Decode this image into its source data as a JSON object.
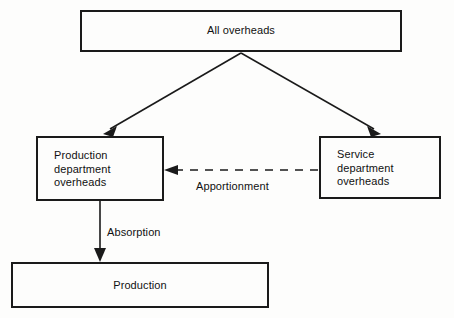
{
  "diagram": {
    "background_color": "#fdfdfc",
    "line_color": "#1a1a1a",
    "text_color": "#111111",
    "nodes": [
      {
        "id": "all_overheads",
        "label": "All overheads",
        "align": "center"
      },
      {
        "id": "production_department_overheads",
        "label": "Production\ndepartment\noverheads",
        "align": "left"
      },
      {
        "id": "service_department_overheads",
        "label": "Service\ndepartment\noverheads",
        "align": "left"
      },
      {
        "id": "production",
        "label": "Production",
        "align": "center"
      }
    ],
    "edges": [
      {
        "id": "all_to_production_dept",
        "from": "all_overheads",
        "to": "production_department_overheads",
        "style": "solid",
        "arrow": "end",
        "label": ""
      },
      {
        "id": "all_to_service_dept",
        "from": "all_overheads",
        "to": "service_department_overheads",
        "style": "solid",
        "arrow": "end",
        "label": ""
      },
      {
        "id": "service_to_production_dept",
        "from": "service_department_overheads",
        "to": "production_department_overheads",
        "style": "dashed",
        "arrow": "end",
        "label": "Apportionment"
      },
      {
        "id": "production_dept_to_production",
        "from": "production_department_overheads",
        "to": "production",
        "style": "solid",
        "arrow": "end",
        "label": "Absorption"
      }
    ]
  }
}
